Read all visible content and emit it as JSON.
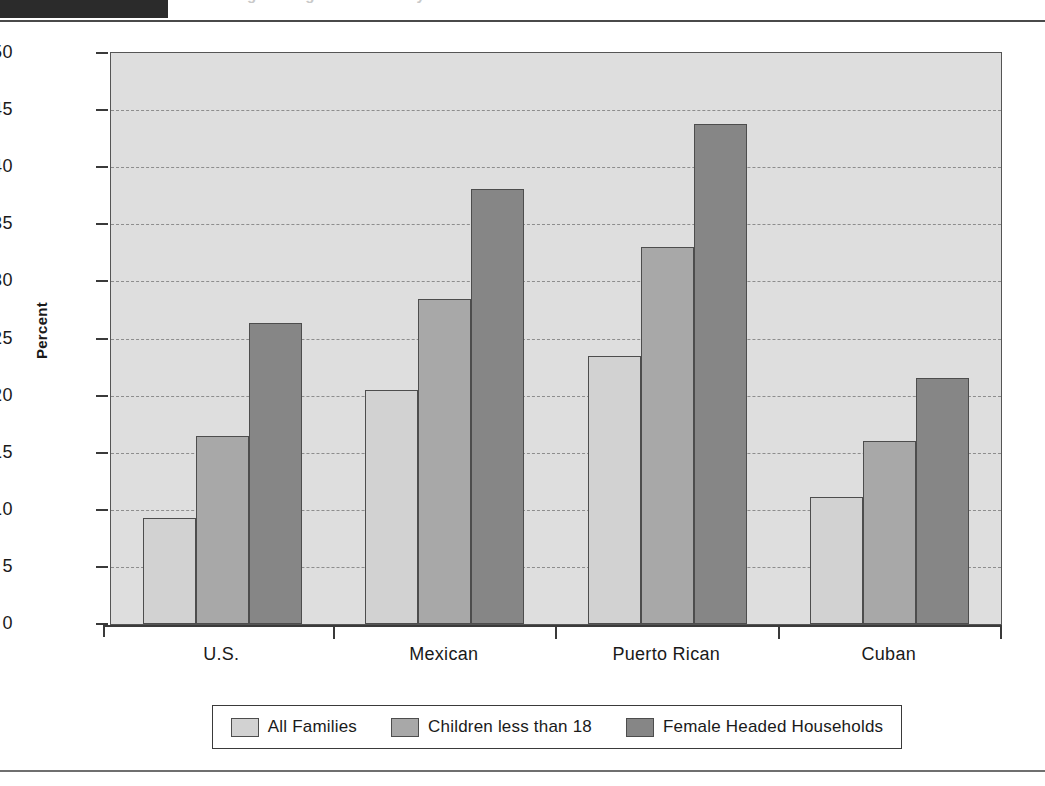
{
  "header": {
    "tab_label": "",
    "title": "Percentage Living Below Poverty Level"
  },
  "chart_data": {
    "type": "bar",
    "title": "",
    "xlabel": "",
    "ylabel": "Percent",
    "ylim": [
      0,
      50
    ],
    "ytick_step": 5,
    "yticks": [
      "50",
      "45",
      "40",
      "35",
      "30",
      "25",
      "20",
      "15",
      "10",
      "5",
      "0"
    ],
    "grid": true,
    "legend_position": "bottom",
    "categories": [
      "U.S.",
      "Mexican",
      "Puerto Rican",
      "Cuban"
    ],
    "series": [
      {
        "name": "All Families",
        "color": "#d2d2d2",
        "values": [
          9.3,
          20.5,
          23.5,
          11.1
        ]
      },
      {
        "name": "Children less than 18",
        "color": "#a8a8a8",
        "values": [
          16.5,
          28.5,
          33.0,
          16.0
        ]
      },
      {
        "name": "Female Headed Households",
        "color": "#868686",
        "values": [
          26.4,
          38.1,
          43.8,
          21.5
        ]
      }
    ]
  }
}
